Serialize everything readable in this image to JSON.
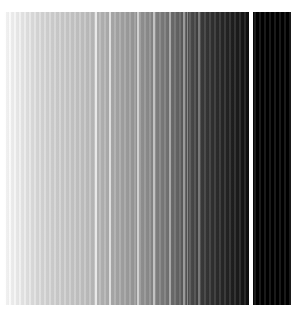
{
  "image": {
    "description": "Grayscale vertical-stripe gradient, white on the left fading to black on the right, with thin light vertical lines and a white gap before a solid black band",
    "colors": {
      "light": "#ffffff",
      "dark": "#000000"
    },
    "stripes": [
      {
        "x": 91,
        "w": 2,
        "color": "#e8e8e8"
      },
      {
        "x": 105,
        "w": 2,
        "color": "#dedede"
      },
      {
        "x": 133,
        "w": 2,
        "color": "#d0d0d0"
      },
      {
        "x": 149,
        "w": 2,
        "color": "#c2c2c2"
      },
      {
        "x": 165,
        "w": 2,
        "color": "#a8a8a8"
      },
      {
        "x": 179,
        "w": 2,
        "color": "#9a9a9a"
      },
      {
        "x": 183,
        "w": 1,
        "color": "#8a8a8a"
      },
      {
        "x": 194,
        "w": 2,
        "color": "#7a7a7a"
      },
      {
        "x": 245,
        "w": 4,
        "color": "#ffffff"
      }
    ]
  }
}
